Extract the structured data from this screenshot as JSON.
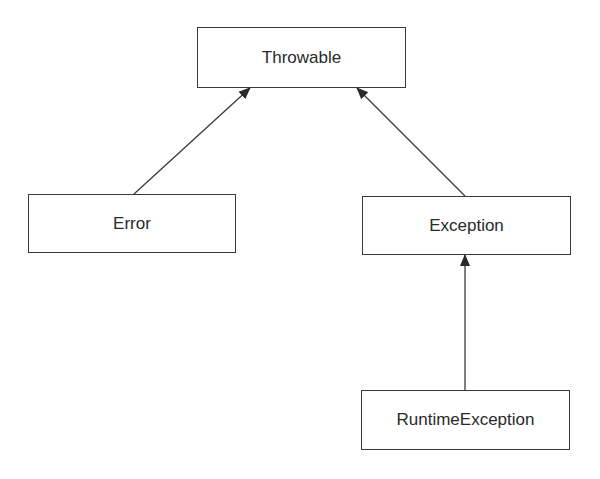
{
  "diagram": {
    "type": "class-hierarchy",
    "nodes": [
      {
        "id": "throwable",
        "label": "Throwable",
        "x": 197,
        "y": 27,
        "w": 209,
        "h": 61
      },
      {
        "id": "error",
        "label": "Error",
        "x": 28,
        "y": 194,
        "w": 208,
        "h": 59
      },
      {
        "id": "exception",
        "label": "Exception",
        "x": 362,
        "y": 196,
        "w": 209,
        "h": 59
      },
      {
        "id": "runtime_exception",
        "label": "RuntimeException",
        "x": 361,
        "y": 390,
        "w": 209,
        "h": 60
      }
    ],
    "edges": [
      {
        "from": "error",
        "to": "throwable",
        "x1": 134,
        "y1": 194,
        "x2": 250,
        "y2": 88,
        "arrow": "filled"
      },
      {
        "from": "exception",
        "to": "throwable",
        "x1": 465,
        "y1": 196,
        "x2": 357,
        "y2": 88,
        "arrow": "filled"
      },
      {
        "from": "runtime_exception",
        "to": "exception",
        "x1": 465,
        "y1": 390,
        "x2": 465,
        "y2": 255,
        "arrow": "filled"
      }
    ],
    "colors": {
      "stroke": "#3a3a3a",
      "text": "#2a2a2a",
      "background": "#ffffff"
    }
  }
}
